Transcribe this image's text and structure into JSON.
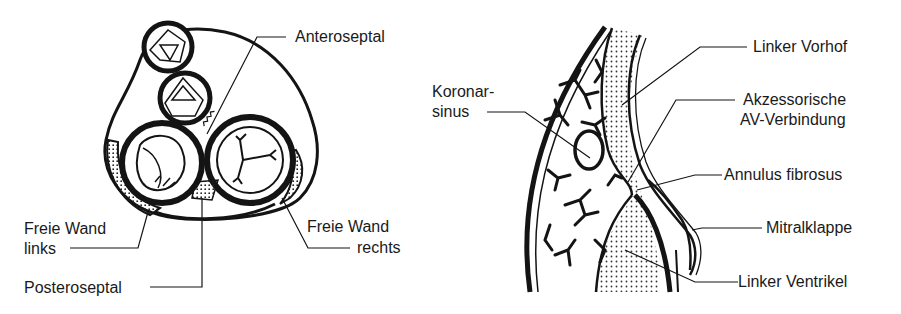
{
  "colors": {
    "ink": "#141414",
    "background": "#ffffff",
    "stipple": "#333333"
  },
  "left_figure": {
    "title": "AV-Ring Querschnitt",
    "labels": {
      "anteroseptal": "Anteroseptal",
      "freie_wand_links_1": "Freie Wand",
      "freie_wand_links_2": "links",
      "freie_wand_rechts_1": "Freie Wand",
      "freie_wand_rechts_2": "rechts",
      "posteroseptal": "Posteroseptal"
    }
  },
  "right_figure": {
    "title": "Längsschnitt AV-Übergang",
    "labels": {
      "koronarsinus_1": "Koronar-",
      "koronarsinus_2": "sinus",
      "linker_vorhof": "Linker Vorhof",
      "akzessorische_1": "Akzessorische",
      "akzessorische_2": "AV-Verbindung",
      "annulus_fibrosus": "Annulus fibrosus",
      "mitralklappe": "Mitralklappe",
      "linker_ventrikel": "Linker Ventrikel"
    }
  }
}
